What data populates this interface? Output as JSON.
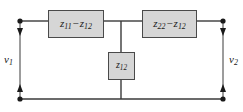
{
  "diagram": {
    "canvas": {
      "width": 243,
      "height": 112,
      "background": "#ffffff"
    },
    "colors": {
      "wire": "#3a3a3a",
      "box_fill": "#d6d6d6",
      "box_border": "#4a4a4a",
      "text": "#1a1a1a",
      "node": "#1a1a1a"
    },
    "components": [
      {
        "id": "z11-minus-z12",
        "label": "z11 − z12",
        "symbol": "z",
        "sub1": "11",
        "operator": "−",
        "symbol2": "z",
        "sub2": "12",
        "orientation": "horizontal",
        "branch": "series-input"
      },
      {
        "id": "z22-minus-z12",
        "label": "z22 − z12",
        "symbol": "z",
        "sub1": "22",
        "operator": "−",
        "symbol2": "z",
        "sub2": "12",
        "orientation": "horizontal",
        "branch": "series-output"
      },
      {
        "id": "z12",
        "label": "z12",
        "symbol": "z",
        "sub1": "12",
        "orientation": "vertical",
        "branch": "shunt"
      }
    ],
    "ports": [
      {
        "id": "port-1",
        "voltage_symbol": "v",
        "voltage_sub": "1",
        "side": "left",
        "arrow": "double-headed-vertical"
      },
      {
        "id": "port-2",
        "voltage_symbol": "v",
        "voltage_sub": "2",
        "side": "right",
        "arrow": "double-headed-vertical"
      }
    ],
    "nodes": [
      {
        "id": "node-top-left",
        "x": 20,
        "y": 21
      },
      {
        "id": "node-bottom-left",
        "x": 20,
        "y": 99
      },
      {
        "id": "node-top-right",
        "x": 223,
        "y": 21
      },
      {
        "id": "node-bottom-right",
        "x": 223,
        "y": 99
      }
    ]
  }
}
